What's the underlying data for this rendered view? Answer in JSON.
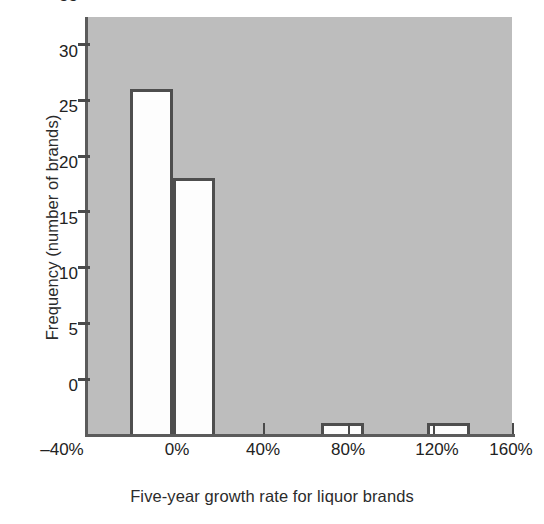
{
  "chart_data": {
    "type": "bar",
    "title": "",
    "subtitle": "",
    "xlabel": "Five-year growth rate for liquor brands",
    "ylabel": "Frequency (number of brands)",
    "xlim": [
      -40,
      160
    ],
    "ylim": [
      0,
      37.5
    ],
    "grid": false,
    "legend": null,
    "x_tick_labels": [
      "–40%",
      "0%",
      "40%",
      "80%",
      "120%",
      "160%"
    ],
    "x_tick_values": [
      -40,
      0,
      40,
      80,
      120,
      160
    ],
    "y_tick_labels": [
      "0",
      "5",
      "10",
      "15",
      "20",
      "25",
      "30",
      "35"
    ],
    "y_tick_values": [
      0,
      5,
      10,
      15,
      20,
      25,
      30,
      35
    ],
    "bin_width": 20,
    "bins": [
      {
        "label": "–20% to 0%",
        "x0": -20,
        "x1": 0,
        "value": 31
      },
      {
        "label": "0% to 20%",
        "x0": 0,
        "x1": 20,
        "value": 23
      },
      {
        "label": "70% to 90%",
        "x0": 70,
        "x1": 90,
        "value": 1
      },
      {
        "label": "120% to 140%",
        "x0": 120,
        "x1": 140,
        "value": 1
      }
    ],
    "categories": [
      "–20% to 0%",
      "0% to 20%",
      "70% to 90%",
      "120% to 140%"
    ],
    "values": [
      31,
      23,
      1,
      1
    ],
    "colors": {
      "plot_background": "#bdbdbd",
      "page_background": "#ffffff",
      "bar_fill": "#fdfdfd",
      "bar_edge": "#4e4e4e",
      "axis": "#5b5b5b",
      "text": "#222222"
    }
  }
}
